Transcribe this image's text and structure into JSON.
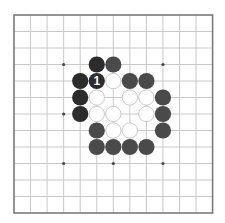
{
  "diagram": {
    "type": "go-board",
    "board_size": 13,
    "colors": {
      "background": "#ffffff",
      "grid_line": "#c9c9c9",
      "border": "#7a7a7a",
      "star_point": "#444444",
      "black_stone_dark": "#2c2c2c",
      "black_stone": "#4a4a4a",
      "white_stone_fill": "#ffffff",
      "white_stone_outline": "#bdbdbd",
      "label_text": "#ffffff"
    },
    "star_points": [
      {
        "col": 3,
        "row": 3
      },
      {
        "col": 9,
        "row": 3
      },
      {
        "col": 3,
        "row": 6
      },
      {
        "col": 6,
        "row": 6
      },
      {
        "col": 9,
        "row": 6
      },
      {
        "col": 3,
        "row": 9
      },
      {
        "col": 6,
        "row": 9
      },
      {
        "col": 9,
        "row": 9
      }
    ],
    "stones": [
      {
        "col": 5,
        "row": 3,
        "color": "black",
        "shade": "dark"
      },
      {
        "col": 6,
        "row": 3,
        "color": "black",
        "shade": "gray"
      },
      {
        "col": 4,
        "row": 4,
        "color": "black",
        "shade": "dark"
      },
      {
        "col": 5,
        "row": 4,
        "color": "black",
        "shade": "dark",
        "label": "1"
      },
      {
        "col": 6,
        "row": 4,
        "color": "white"
      },
      {
        "col": 7,
        "row": 4,
        "color": "black",
        "shade": "gray"
      },
      {
        "col": 8,
        "row": 4,
        "color": "black",
        "shade": "gray"
      },
      {
        "col": 4,
        "row": 5,
        "color": "black",
        "shade": "dark"
      },
      {
        "col": 5,
        "row": 5,
        "color": "white"
      },
      {
        "col": 7,
        "row": 5,
        "color": "white"
      },
      {
        "col": 8,
        "row": 5,
        "color": "white"
      },
      {
        "col": 9,
        "row": 5,
        "color": "black",
        "shade": "gray"
      },
      {
        "col": 4,
        "row": 6,
        "color": "black",
        "shade": "dark"
      },
      {
        "col": 5,
        "row": 6,
        "color": "white"
      },
      {
        "col": 6,
        "row": 6,
        "color": "white"
      },
      {
        "col": 8,
        "row": 6,
        "color": "white"
      },
      {
        "col": 9,
        "row": 6,
        "color": "black",
        "shade": "gray"
      },
      {
        "col": 5,
        "row": 7,
        "color": "black",
        "shade": "gray"
      },
      {
        "col": 6,
        "row": 7,
        "color": "white"
      },
      {
        "col": 7,
        "row": 7,
        "color": "white"
      },
      {
        "col": 9,
        "row": 7,
        "color": "black",
        "shade": "gray"
      },
      {
        "col": 5,
        "row": 8,
        "color": "black",
        "shade": "gray"
      },
      {
        "col": 6,
        "row": 8,
        "color": "black",
        "shade": "gray"
      },
      {
        "col": 7,
        "row": 8,
        "color": "black",
        "shade": "gray"
      },
      {
        "col": 8,
        "row": 8,
        "color": "black",
        "shade": "gray"
      }
    ],
    "move_labels": [
      "1"
    ]
  }
}
